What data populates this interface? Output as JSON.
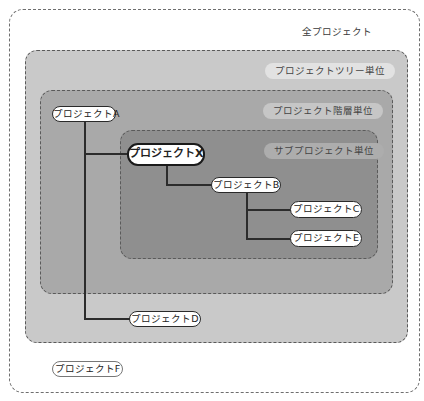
{
  "diagram": {
    "scopes": [
      {
        "id": "all",
        "label": "全プロジェクト"
      },
      {
        "id": "tree",
        "label": "プロジェクトツリー単位"
      },
      {
        "id": "hierarchy",
        "label": "プロジェクト階層単位"
      },
      {
        "id": "subproject",
        "label": "サブプロジェクト単位"
      }
    ],
    "nodes": {
      "a": {
        "label": "プロジェクトA"
      },
      "x": {
        "label": "プロジェクトX"
      },
      "b": {
        "label": "プロジェクトB"
      },
      "c": {
        "label": "プロジェクトC"
      },
      "e": {
        "label": "プロジェクトE"
      },
      "d": {
        "label": "プロジェクトD"
      },
      "f": {
        "label": "プロジェクトF"
      }
    },
    "edges": [
      {
        "from": "プロジェクトA",
        "to": "プロジェクトX"
      },
      {
        "from": "プロジェクトA",
        "to": "プロジェクトD"
      },
      {
        "from": "プロジェクトX",
        "to": "プロジェクトB"
      },
      {
        "from": "プロジェクトB",
        "to": "プロジェクトC"
      },
      {
        "from": "プロジェクトB",
        "to": "プロジェクトE"
      }
    ],
    "colors": {
      "all": "#ffffff",
      "tree": "#c9c9c9",
      "hierarchy": "#a9a9a9",
      "subproject": "#8f8f8f"
    }
  }
}
